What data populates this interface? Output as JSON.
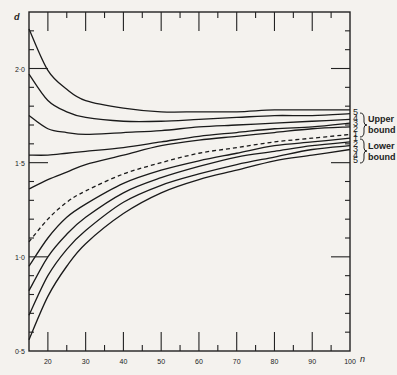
{
  "chart_data": {
    "type": "line",
    "title": "",
    "xlabel": "n",
    "ylabel": "d",
    "xlim": [
      15,
      100
    ],
    "ylim": [
      0.5,
      2.3
    ],
    "x_ticks": [
      20,
      30,
      40,
      50,
      60,
      70,
      80,
      90,
      100
    ],
    "x_tick_labels": [
      "20",
      "30",
      "40",
      "50",
      "60",
      "70",
      "80",
      "90",
      "100"
    ],
    "y_ticks": [
      0.5,
      1.0,
      1.5,
      2.0
    ],
    "y_tick_labels": [
      "0·5",
      "1·0",
      "1·5",
      "2·0"
    ],
    "grid": false,
    "x": [
      15,
      20,
      25,
      30,
      40,
      50,
      60,
      70,
      80,
      90,
      100
    ],
    "series": [
      {
        "name": "Upper bound 5",
        "group": "upper",
        "style": "solid",
        "values": [
          2.21,
          1.99,
          1.89,
          1.83,
          1.79,
          1.77,
          1.77,
          1.77,
          1.78,
          1.78,
          1.78
        ]
      },
      {
        "name": "Upper bound 4",
        "group": "upper",
        "style": "solid",
        "values": [
          1.97,
          1.83,
          1.77,
          1.74,
          1.72,
          1.72,
          1.73,
          1.74,
          1.75,
          1.75,
          1.76
        ]
      },
      {
        "name": "Upper bound 3",
        "group": "upper",
        "style": "solid",
        "values": [
          1.75,
          1.68,
          1.66,
          1.65,
          1.66,
          1.67,
          1.69,
          1.7,
          1.71,
          1.72,
          1.73
        ]
      },
      {
        "name": "Upper bound 2",
        "group": "upper",
        "style": "solid",
        "values": [
          1.54,
          1.54,
          1.55,
          1.56,
          1.58,
          1.61,
          1.64,
          1.66,
          1.68,
          1.69,
          1.71
        ]
      },
      {
        "name": "Upper bound 1",
        "group": "upper",
        "style": "solid",
        "values": [
          1.36,
          1.41,
          1.45,
          1.49,
          1.54,
          1.59,
          1.62,
          1.64,
          1.66,
          1.68,
          1.69
        ]
      },
      {
        "name": "Lower bound 1",
        "group": "lower",
        "style": "dashed",
        "values": [
          1.08,
          1.2,
          1.29,
          1.35,
          1.44,
          1.5,
          1.55,
          1.58,
          1.61,
          1.63,
          1.65
        ]
      },
      {
        "name": "Lower bound 2",
        "group": "lower",
        "style": "solid",
        "values": [
          0.95,
          1.1,
          1.21,
          1.28,
          1.39,
          1.46,
          1.51,
          1.55,
          1.59,
          1.61,
          1.63
        ]
      },
      {
        "name": "Lower bound 3",
        "group": "lower",
        "style": "solid",
        "values": [
          0.82,
          1.0,
          1.12,
          1.21,
          1.34,
          1.42,
          1.48,
          1.53,
          1.56,
          1.59,
          1.61
        ]
      },
      {
        "name": "Lower bound 4",
        "group": "lower",
        "style": "solid",
        "values": [
          0.69,
          0.9,
          1.04,
          1.14,
          1.29,
          1.38,
          1.44,
          1.49,
          1.53,
          1.57,
          1.59
        ]
      },
      {
        "name": "Lower bound 5",
        "group": "lower",
        "style": "solid",
        "values": [
          0.56,
          0.79,
          0.95,
          1.07,
          1.23,
          1.34,
          1.41,
          1.46,
          1.51,
          1.54,
          1.57
        ]
      }
    ],
    "annotations": [
      {
        "text": "Upper",
        "group": "upper"
      },
      {
        "text": "bound",
        "group": "upper"
      },
      {
        "text": "Lower",
        "group": "lower"
      },
      {
        "text": "bound",
        "group": "lower"
      }
    ],
    "right_labels_upper": [
      "5",
      "4",
      "3",
      "2",
      "1"
    ],
    "right_labels_lower": [
      "1",
      "2",
      "3",
      "4",
      "5"
    ],
    "legend": "none"
  },
  "labels": {
    "y_axis": "d",
    "x_axis": "n",
    "upper_line1": "Upper",
    "upper_line2": "bound",
    "lower_line1": "Lower",
    "lower_line2": "bound"
  }
}
